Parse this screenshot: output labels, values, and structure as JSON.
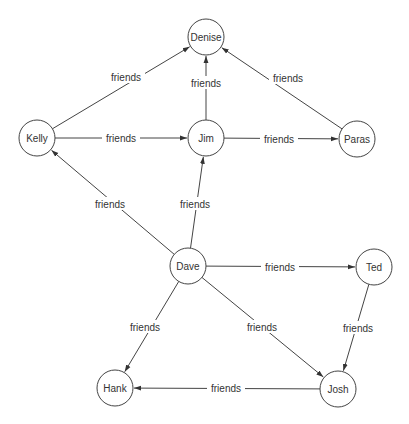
{
  "diagram": {
    "type": "directed-graph",
    "colors": {
      "stroke": "#444444",
      "text": "#333333",
      "background": "#ffffff"
    },
    "node_radius": 18,
    "nodes": [
      {
        "id": "denise",
        "label": "Denise",
        "x": 206,
        "y": 37
      },
      {
        "id": "kelly",
        "label": "Kelly",
        "x": 37,
        "y": 138
      },
      {
        "id": "jim",
        "label": "Jim",
        "x": 206,
        "y": 138
      },
      {
        "id": "paras",
        "label": "Paras",
        "x": 357,
        "y": 139
      },
      {
        "id": "dave",
        "label": "Dave",
        "x": 188,
        "y": 266
      },
      {
        "id": "ted",
        "label": "Ted",
        "x": 374,
        "y": 267
      },
      {
        "id": "hank",
        "label": "Hank",
        "x": 115,
        "y": 388
      },
      {
        "id": "josh",
        "label": "Josh",
        "x": 338,
        "y": 389
      }
    ],
    "edges": [
      {
        "from": "kelly",
        "to": "denise",
        "label": "friends",
        "lx": 126,
        "ly": 77
      },
      {
        "from": "jim",
        "to": "denise",
        "label": "friends",
        "lx": 206,
        "ly": 83
      },
      {
        "from": "paras",
        "to": "denise",
        "label": "friends",
        "lx": 288,
        "ly": 78
      },
      {
        "from": "kelly",
        "to": "jim",
        "label": "friends",
        "lx": 121,
        "ly": 138
      },
      {
        "from": "jim",
        "to": "paras",
        "label": "friends",
        "lx": 279,
        "ly": 139
      },
      {
        "from": "dave",
        "to": "kelly",
        "label": "friends",
        "lx": 110,
        "ly": 204
      },
      {
        "from": "dave",
        "to": "jim",
        "label": "friends",
        "lx": 195,
        "ly": 204
      },
      {
        "from": "dave",
        "to": "ted",
        "label": "friends",
        "lx": 280,
        "ly": 267
      },
      {
        "from": "dave",
        "to": "hank",
        "label": "friends",
        "lx": 145,
        "ly": 327
      },
      {
        "from": "dave",
        "to": "josh",
        "label": "friends",
        "lx": 262,
        "ly": 327
      },
      {
        "from": "ted",
        "to": "josh",
        "label": "friends",
        "lx": 358,
        "ly": 328
      },
      {
        "from": "josh",
        "to": "hank",
        "label": "friends",
        "lx": 226,
        "ly": 388
      }
    ]
  }
}
